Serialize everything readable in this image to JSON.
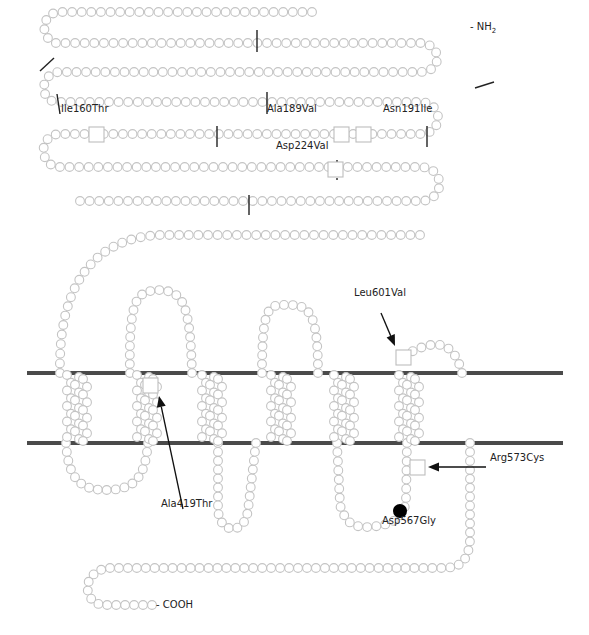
{
  "figure": {
    "type": "membrane protein topology diagram",
    "colors": {
      "residue_stroke": "#c4c4c4",
      "membrane": "#4a4a4a",
      "mutation_marker": "#000000",
      "text": "#222222"
    },
    "termini": {
      "n_term": {
        "prefix": "- NH",
        "sub": "2"
      },
      "c_term": {
        "label": "- COOH"
      }
    },
    "membrane_lines": [
      {
        "y": 373,
        "x1": 27,
        "x2": 563
      },
      {
        "y": 443,
        "x1": 27,
        "x2": 563
      }
    ],
    "chain_segments": [
      {
        "d": "M 312 12 L 160 12 L 60 12 C 42 12 38 38 56 43 L 312 43 L 420 43 C 442 43 444 72 420 72 L 312 72 L 60 72 C 40 72 38 102 58 102 L 312 102 L 420 102 C 444 102 444 134 420 134 L 312 134 L 60 134 C 38 134 38 167 60 167 L 312 167 L 420 167 C 446 167 446 201 420 201 L 312 201 L 80 201",
        "spacing": 9.6
      },
      {
        "d": "M 420 235 L 160 235 C 90 238 58 290 60 373",
        "spacing": 9.6
      },
      {
        "d": "M 130 373 C 128 290 140 292 160 290 C 182 292 190 300 192 373",
        "spacing": 9.0
      },
      {
        "d": "M 262 373 C 262 300 270 305 290 305 C 310 305 318 315 318 373",
        "spacing": 9.0
      },
      {
        "d": "M 404 355 L 420 348 C 440 340 455 345 462 373",
        "spacing": 9.0
      },
      {
        "d": "M 66 443 C 68 478 80 490 105 490 C 135 490 145 478 148 443",
        "spacing": 9.0
      },
      {
        "d": "M 218 443 L 218 510 C 220 535 245 535 248 510 L 256 443",
        "spacing": 9.0
      },
      {
        "d": "M 407 443 L 406 500 C 404 520 390 525 370 527 C 350 528 345 520 340 505 L 337 443",
        "spacing": 9.0
      },
      {
        "d": "M 470 443 L 470 540 C 468 563 460 568 440 568 L 110 568 C 80 570 82 605 105 605 L 152 605",
        "spacing": 9.0
      }
    ],
    "helices": [
      {
        "x": 78,
        "y1": 373,
        "y2": 443
      },
      {
        "x": 148,
        "y1": 373,
        "y2": 443
      },
      {
        "x": 213,
        "y1": 373,
        "y2": 443
      },
      {
        "x": 282,
        "y1": 373,
        "y2": 443
      },
      {
        "x": 345,
        "y1": 373,
        "y2": 443
      },
      {
        "x": 410,
        "y1": 373,
        "y2": 443
      }
    ],
    "cut_marks": [
      {
        "x1": 40,
        "y1": 71,
        "x2": 54,
        "y2": 58
      },
      {
        "x1": 257,
        "y1": 30,
        "x2": 257,
        "y2": 52
      },
      {
        "x1": 57,
        "y1": 94,
        "x2": 60,
        "y2": 114
      },
      {
        "x1": 267,
        "y1": 92,
        "x2": 267,
        "y2": 114
      },
      {
        "x1": 475,
        "y1": 88,
        "x2": 494,
        "y2": 82
      },
      {
        "x1": 217,
        "y1": 126,
        "x2": 217,
        "y2": 147
      },
      {
        "x1": 427,
        "y1": 126,
        "x2": 427,
        "y2": 147
      },
      {
        "x1": 249,
        "y1": 195,
        "x2": 249,
        "y2": 215
      },
      {
        "x1": 337,
        "y1": 160,
        "x2": 337,
        "y2": 162
      },
      {
        "x1": 337,
        "y1": 178,
        "x2": 337,
        "y2": 180
      }
    ],
    "variant_boxes": [
      {
        "x": 89,
        "y": 127,
        "size": 15
      },
      {
        "x": 334,
        "y": 127,
        "size": 15
      },
      {
        "x": 356,
        "y": 127,
        "size": 15
      },
      {
        "x": 328,
        "y": 162,
        "size": 15
      },
      {
        "x": 143,
        "y": 378,
        "size": 15
      },
      {
        "x": 396,
        "y": 350,
        "size": 15
      },
      {
        "x": 410,
        "y": 460,
        "size": 15
      }
    ],
    "variant_dots": [
      {
        "cx": 400,
        "cy": 511,
        "r": 7
      }
    ],
    "arrows": [
      {
        "x1": 381,
        "y1": 313,
        "x2": 395,
        "y2": 346
      },
      {
        "x1": 183,
        "y1": 509,
        "x2": 159,
        "y2": 396
      },
      {
        "x1": 486,
        "y1": 467,
        "x2": 428,
        "y2": 467
      }
    ],
    "labels": [
      {
        "text": "Ile160Thr",
        "x": 61,
        "y": 113
      },
      {
        "text": "Ala189Val",
        "x": 267,
        "y": 113
      },
      {
        "text": "Asn191Ile",
        "x": 383,
        "y": 113
      },
      {
        "text": "Asp224Val",
        "x": 276,
        "y": 150
      },
      {
        "text": "Leu601Val",
        "x": 354,
        "y": 297
      },
      {
        "text": "Ala419Thr",
        "x": 161,
        "y": 508
      },
      {
        "text": "Arg573Cys",
        "x": 490,
        "y": 462
      },
      {
        "text": "Asp567Gly",
        "x": 382,
        "y": 525
      }
    ],
    "c_term_label_pos": {
      "x": 156,
      "y": 600
    },
    "n_term_label_pos": {
      "x": 470,
      "y": 29
    }
  }
}
